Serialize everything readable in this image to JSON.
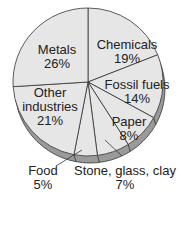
{
  "chart_data": {
    "type": "pie",
    "title": "",
    "start_angle_deg": 0,
    "direction": "clockwise",
    "slices": [
      {
        "label": "Chemicals",
        "value": 19,
        "value_label": "19%"
      },
      {
        "label": "Fossil fuels",
        "value": 14,
        "value_label": "14%"
      },
      {
        "label": "Paper",
        "value": 8,
        "value_label": "8%"
      },
      {
        "label": "Stone, glass, clay",
        "value": 7,
        "value_label": "7%"
      },
      {
        "label": "Food",
        "value": 5,
        "value_label": "5%"
      },
      {
        "label": "Other industries",
        "value": 21,
        "value_label": "21%"
      },
      {
        "label": "Metals",
        "value": 26,
        "value_label": "26%"
      }
    ],
    "style": {
      "fill": "#e6e6e6",
      "rim": "#9a9a9a",
      "stroke": "#333333"
    }
  },
  "labels": {
    "metals": {
      "name": "Metals",
      "pct": "26%"
    },
    "chemicals": {
      "name": "Chemicals",
      "pct": "19%"
    },
    "fossil": {
      "name": "Fossil fuels",
      "pct": "14%"
    },
    "other_1": "Other",
    "other_2": "industries",
    "other_pct": "21%",
    "paper": {
      "name": "Paper",
      "pct": "8%"
    },
    "food": {
      "name": "Food",
      "pct": "5%"
    },
    "stone": {
      "name": "Stone, glass, clay",
      "pct": "7%"
    }
  }
}
